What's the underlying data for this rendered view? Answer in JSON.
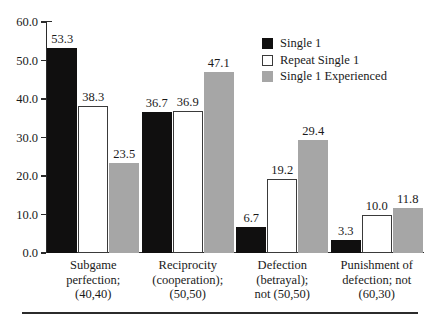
{
  "chart_data": {
    "type": "bar",
    "title": "",
    "subtitle": "",
    "xlabel": "",
    "ylabel": "",
    "ylim": [
      0.0,
      60.0
    ],
    "grid": false,
    "legend_position": "top-right",
    "ytick_labels": [
      "60.0",
      "50.0",
      "40.0",
      "30.0",
      "20.0",
      "10.0",
      "0.0"
    ],
    "ytick_values": [
      60.0,
      50.0,
      40.0,
      30.0,
      20.0,
      10.0,
      0.0
    ],
    "categories": [
      "Subgame perfection; (40,40)",
      "Reciprocity (cooperation); (50,50)",
      "Defection (betrayal); not (50,50)",
      "Punishment of defection; not (60,30)"
    ],
    "category_lines": [
      [
        "Subgame",
        "perfection;",
        "(40,40)"
      ],
      [
        "Reciprocity",
        "(cooperation);",
        "(50,50)"
      ],
      [
        "Defection",
        "(betrayal);",
        "not (50,50)"
      ],
      [
        "Punishment of",
        "defection; not",
        "(60,30)"
      ]
    ],
    "series": [
      {
        "name": "Single 1",
        "color": "#100f0f",
        "values": [
          53.3,
          36.7,
          6.7,
          3.3
        ],
        "labels": [
          "53.3",
          "36.7",
          "6.7",
          "3.3"
        ]
      },
      {
        "name": "Repeat Single 1",
        "color": "#ffffff",
        "values": [
          38.3,
          36.9,
          19.2,
          10.0
        ],
        "labels": [
          "38.3",
          "36.9",
          "19.2",
          "10.0"
        ]
      },
      {
        "name": "Single 1 Experienced",
        "color": "#a6a6a6",
        "values": [
          23.5,
          47.1,
          29.4,
          11.8
        ],
        "labels": [
          "23.5",
          "47.1",
          "29.4",
          "11.8"
        ]
      }
    ]
  },
  "colors": {
    "series_1": "#100f0f",
    "series_2": "#ffffff",
    "series_3": "#a6a6a6",
    "axis": "#2b2b2b",
    "text": "#1a1a1a",
    "background": "#ffffff"
  }
}
